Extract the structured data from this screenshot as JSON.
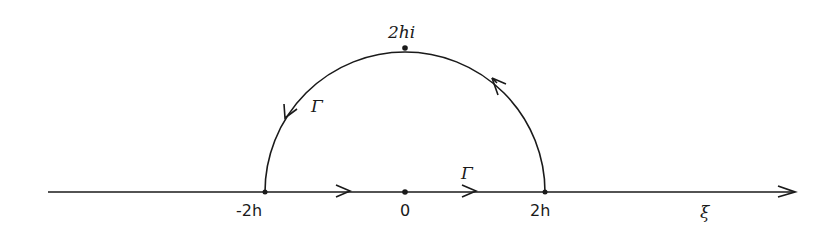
{
  "diagram": {
    "type": "contour-diagram",
    "axis": {
      "label": "ξ",
      "x_start": 48,
      "x_end": 795,
      "y": 192,
      "direction": "right"
    },
    "points": [
      {
        "id": "minus-2h",
        "label": "-2h",
        "x": 265,
        "y": 192
      },
      {
        "id": "origin",
        "label": "0",
        "x": 405,
        "y": 192
      },
      {
        "id": "plus-2h",
        "label": "2h",
        "x": 545,
        "y": 192
      },
      {
        "id": "top",
        "label": "2hi",
        "x": 405,
        "y": 48
      }
    ],
    "contour": {
      "name": "Γ",
      "label_arc": "Γ",
      "label_axis": "Γ",
      "center": [
        405,
        192
      ],
      "radius": 140,
      "orientation": "counterclockwise",
      "arrows": [
        {
          "on": "axis",
          "x": 345,
          "direction": "right"
        },
        {
          "on": "axis",
          "x": 475,
          "direction": "right"
        },
        {
          "on": "arc",
          "position": "upper-right",
          "direction": "counterclockwise"
        },
        {
          "on": "arc",
          "position": "upper-left",
          "direction": "counterclockwise"
        }
      ]
    },
    "colors": {
      "stroke": "#1a1a1a",
      "background": "#ffffff"
    }
  }
}
